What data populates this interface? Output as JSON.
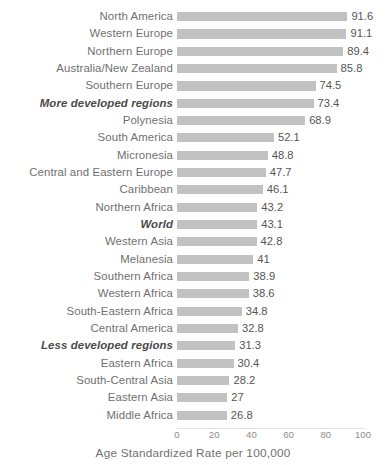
{
  "chart_data": {
    "type": "bar",
    "orientation": "horizontal",
    "title": "",
    "xlabel": "Age Standardized Rate per 100,000",
    "ylabel": "",
    "xlim": [
      0,
      100
    ],
    "xticks": [
      0,
      20,
      40,
      60,
      80,
      100
    ],
    "grid": false,
    "legend": null,
    "bar_color": "#c2c2c2",
    "label_color": "#6f6f6f",
    "value_color": "#555555",
    "categories": [
      "North America",
      "Western Europe",
      "Northern Europe",
      "Australia/New Zealand",
      "Southern Europe",
      "More developed regions",
      "Polynesia",
      "South America",
      "Micronesia",
      "Central and Eastern Europe",
      "Caribbean",
      "Northern Africa",
      "World",
      "Western Asia",
      "Melanesia",
      "Southern Africa",
      "Western Africa",
      "South-Eastern Africa",
      "Central America",
      "Less developed regions",
      "Eastern Africa",
      "South-Central Asia",
      "Eastern Asia",
      "Middle Africa"
    ],
    "values": [
      91.6,
      91.1,
      89.4,
      85.8,
      74.5,
      73.4,
      68.9,
      52.1,
      48.8,
      47.7,
      46.1,
      43.2,
      43.1,
      42.8,
      41,
      38.9,
      38.6,
      34.8,
      32.8,
      31.3,
      30.4,
      28.2,
      27,
      26.8
    ],
    "value_labels": [
      "91.6",
      "91.1",
      "89.4",
      "85.8",
      "74.5",
      "73.4",
      "68.9",
      "52.1",
      "48.8",
      "47.7",
      "46.1",
      "43.2",
      "43.1",
      "42.8",
      "41",
      "38.9",
      "38.6",
      "34.8",
      "32.8",
      "31.3",
      "30.4",
      "28.2",
      "27",
      "26.8"
    ],
    "emphasized": [
      false,
      false,
      false,
      false,
      false,
      true,
      false,
      false,
      false,
      false,
      false,
      false,
      true,
      false,
      false,
      false,
      false,
      false,
      false,
      true,
      false,
      false,
      false,
      false
    ]
  },
  "axis": {
    "tick_labels": [
      "0",
      "20",
      "40",
      "60",
      "80",
      "100"
    ],
    "title": "Age Standardized Rate per 100,000"
  }
}
